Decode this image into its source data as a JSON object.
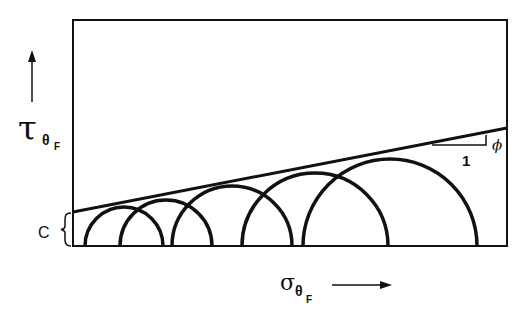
{
  "diagram": {
    "y_axis_label": {
      "symbol": "τ",
      "subscript": "θ",
      "sub_subscript": "F"
    },
    "x_axis_label": {
      "symbol": "σ",
      "subscript": "θ",
      "sub_subscript": "F"
    },
    "cohesion_label": "C",
    "slope_run_label": "1",
    "slope_angle_label": "ϕ",
    "stroke_color": "#111111",
    "background_color": "#ffffff",
    "frame": {
      "x1": 73,
      "y1": 20,
      "x2": 507,
      "y2": 246
    },
    "envelope_line": {
      "x1": 73,
      "y1": 212,
      "x2": 507,
      "y2": 128
    },
    "mohr_circles": [
      {
        "cx": 124,
        "r": 39
      },
      {
        "cx": 166,
        "r": 46
      },
      {
        "cx": 232,
        "r": 60
      },
      {
        "cx": 315,
        "r": 73
      },
      {
        "cx": 390,
        "r": 87
      }
    ]
  }
}
